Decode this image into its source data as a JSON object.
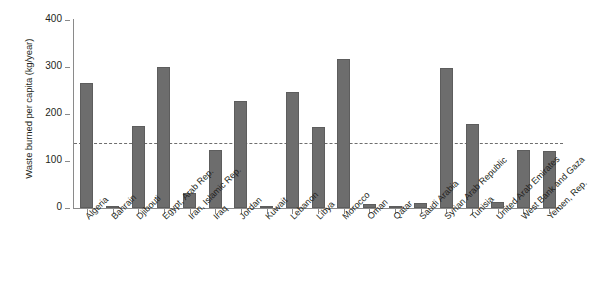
{
  "chart_data": {
    "type": "bar",
    "title": "",
    "subtitle": "",
    "xlabel": "",
    "ylabel": "Waste burned per capita (kg/year)",
    "ylim": [
      0,
      400
    ],
    "yticks": [
      0,
      100,
      200,
      300,
      400
    ],
    "grid": false,
    "legend": "none",
    "bar_color": "#6d6d6d",
    "axis_color": "#8a8a8a",
    "reference_line": {
      "value": 139,
      "style": "dashed",
      "color": "#6e6e6e",
      "label": ""
    },
    "categories": [
      "Algeria",
      "Bahrain",
      "Djibouti",
      "Egypt, Arab Rep.",
      "Iran, Islamic Rep.",
      "Iraq",
      "Jordan",
      "Kuwait",
      "Lebanon",
      "Libya",
      "Morocco",
      "Oman",
      "Qatar",
      "Saudi Arabia",
      "Syrian Arab Republic",
      "Tunisia",
      "United Arab Emirates",
      "West Bank and Gaza",
      "Yemen, Rep."
    ],
    "values": [
      266,
      5,
      174,
      300,
      33,
      124,
      227,
      4,
      246,
      172,
      316,
      8,
      1,
      10,
      297,
      178,
      12,
      124,
      122
    ]
  }
}
